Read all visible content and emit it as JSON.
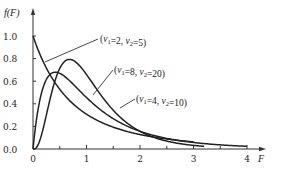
{
  "chart_data": {
    "type": "line",
    "title": "",
    "xlabel": "F",
    "ylabel": "f(F)",
    "xlim": [
      0,
      4.4
    ],
    "ylim": [
      0,
      1.05
    ],
    "grid": false,
    "x_ticks": [
      "0",
      "1",
      "2",
      "3",
      "4"
    ],
    "x_minor_ticks": [
      0.5,
      1.5,
      2.5,
      3.5
    ],
    "y_ticks": [
      "0.0",
      "0.2",
      "0.4",
      "0.6",
      "0.8",
      "1.0"
    ],
    "legend": "inline annotations",
    "series": [
      {
        "name": "(ν1=2, ν2=5)",
        "nu1": 2,
        "nu2": 5,
        "x": [
          0,
          0.25,
          0.5,
          0.75,
          1.0,
          1.5,
          2.0,
          2.5,
          3.0
        ],
        "values": [
          1.0,
          0.75,
          0.57,
          0.44,
          0.35,
          0.22,
          0.15,
          0.1,
          0.07
        ]
      },
      {
        "name": "(ν1=8, ν2=20)",
        "nu1": 8,
        "nu2": 20,
        "x": [
          0,
          0.25,
          0.5,
          0.68,
          1.0,
          1.5,
          2.0,
          2.5,
          3.0,
          3.2
        ],
        "values": [
          0.0,
          0.41,
          0.74,
          0.79,
          0.66,
          0.33,
          0.13,
          0.05,
          0.02,
          0.01
        ]
      },
      {
        "name": "(ν1=4, ν2=10)",
        "nu1": 4,
        "nu2": 10,
        "x": [
          0,
          0.25,
          0.42,
          0.75,
          1.0,
          1.5,
          2.0,
          2.5,
          3.0,
          3.5,
          4.0
        ],
        "values": [
          0.0,
          0.6,
          0.7,
          0.62,
          0.5,
          0.29,
          0.16,
          0.09,
          0.05,
          0.03,
          0.02
        ]
      }
    ],
    "annotations": [
      {
        "series": 0,
        "label_nu1": "2",
        "label_nu2": "5"
      },
      {
        "series": 1,
        "label_nu1": "8",
        "label_nu2": "20"
      },
      {
        "series": 2,
        "label_nu1": "4",
        "label_nu2": "10"
      }
    ]
  },
  "labels": {
    "y_axis": "f(F)",
    "x_axis": "F",
    "nu": "ν",
    "sub1": "1",
    "sub2": "2",
    "eq": "=",
    "sep": ",  ",
    "open": "(",
    "close": ")"
  }
}
